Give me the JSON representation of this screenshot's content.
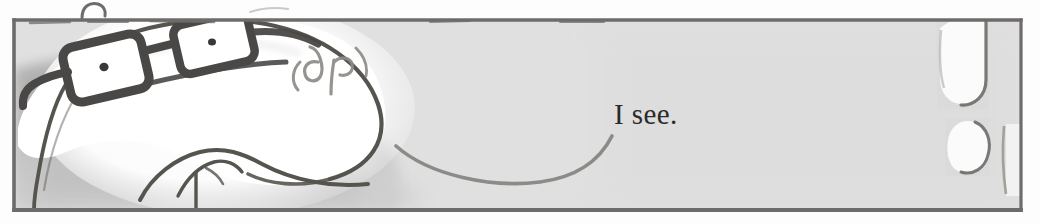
{
  "panel": {
    "name": "comic-panel",
    "caption_text": "I see.",
    "frame": {
      "x": 13,
      "y": 19,
      "width": 1009,
      "height": 192,
      "border_color": "#6e6c6a",
      "background_color": "#e3e3e3"
    },
    "page_background_color": "#fdfdfd",
    "ink_color": "#4a4846",
    "highlight_color": "#ffffff",
    "shadow_color": "#b3b3b3",
    "midtone_color": "#cfcfcf"
  },
  "characters": {
    "speaker": {
      "name": "bald-man-with-glasses",
      "description": "Large bald head in profile at left, wearing rectangular eyeglasses",
      "features": [
        {
          "name": "left-lens",
          "label": "left eyeglass lens"
        },
        {
          "name": "right-lens",
          "label": "right eyeglass lens"
        },
        {
          "name": "nose-bridge",
          "label": "eyeglass bridge"
        },
        {
          "name": "temple-arm",
          "label": "eyeglass temple arm"
        },
        {
          "name": "left-pupil",
          "label": "left pupil dot"
        },
        {
          "name": "right-pupil",
          "label": "right pupil dot"
        },
        {
          "name": "ear-scribble",
          "label": "(9 p)"
        },
        {
          "name": "chin-line",
          "label": "chin and jaw contour"
        },
        {
          "name": "neck-line",
          "label": "neck contour"
        }
      ]
    },
    "listener": {
      "name": "offscreen-figure",
      "description": "Partial white shapes entering frame at right edge",
      "features": [
        {
          "name": "upper-finger-shape",
          "label": "rounded vertical shape"
        },
        {
          "name": "lower-blob-shape",
          "label": "rounded blob shape"
        }
      ]
    }
  },
  "marks": {
    "horizon_curve": {
      "name": "shallow-smile-curve",
      "label": "shallow curved line across lower middle"
    },
    "frame_break_stroke": {
      "name": "hook-stroke-above-panel",
      "label": "small hook stroke above the panel border"
    },
    "top_dashes": {
      "name": "dashed-accent-strokes",
      "label": "short horizontal accent strokes along the top border"
    }
  }
}
